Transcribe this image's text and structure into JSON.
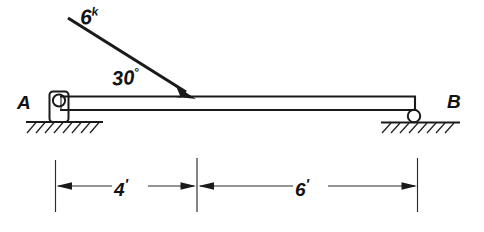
{
  "figure": {
    "background_color": "#ffffff",
    "line_color": "#1a1a1a"
  },
  "load": {
    "magnitude_label": "6",
    "unit_superscript": "k",
    "magnitude_value": 6,
    "unit": "kips",
    "angle_label": "30",
    "angle_degree_symbol": "°",
    "angle_value": 30,
    "direction": "down-and-to-the-right",
    "applied_at_distance_from_a": "4'"
  },
  "supports": {
    "left": {
      "label": "A",
      "type": "pin"
    },
    "right": {
      "label": "B",
      "type": "roller"
    }
  },
  "dimensions": [
    {
      "label": "4",
      "tick_mark": "'",
      "value": 4,
      "unit": "ft",
      "from": "A",
      "to": "load point"
    },
    {
      "label": "6",
      "tick_mark": "'",
      "value": 6,
      "unit": "ft",
      "from": "load point",
      "to": "B"
    }
  ],
  "beam": {
    "total_span_label": "10'",
    "total_span_value": 10,
    "unit": "ft"
  }
}
